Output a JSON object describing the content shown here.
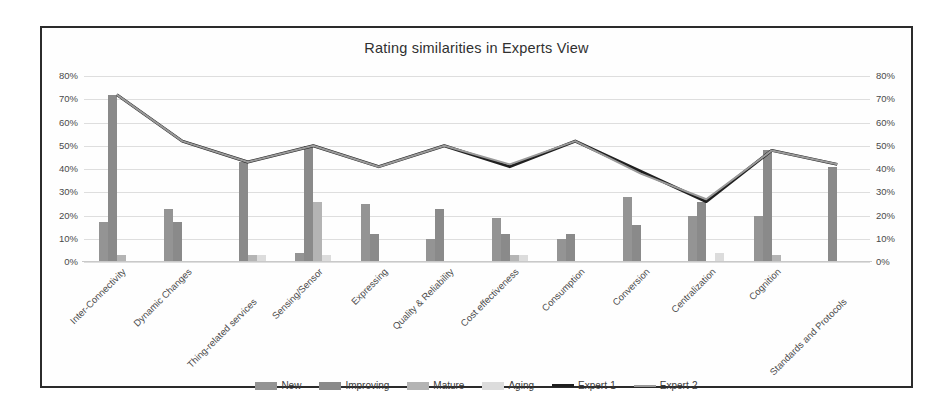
{
  "chart": {
    "title": "Rating similarities in Experts View",
    "legend_position": "bottom"
  },
  "axis": {
    "ticks": [
      "80%",
      "70%",
      "60%",
      "50%",
      "40%",
      "30%",
      "20%",
      "10%",
      "0%"
    ],
    "ylim": [
      0,
      80
    ]
  },
  "legend": [
    {
      "label": "New",
      "key": "new",
      "color": "#949494",
      "type": "bar"
    },
    {
      "label": "Improving",
      "key": "improving",
      "color": "#8a8a8a",
      "type": "bar"
    },
    {
      "label": "Mature",
      "key": "mature",
      "color": "#b4b4b4",
      "type": "bar"
    },
    {
      "label": "Aging",
      "key": "aging",
      "color": "#dcdcdc",
      "type": "bar"
    },
    {
      "label": "Expert-1",
      "key": "expert1",
      "color": "#1f1f1f",
      "type": "line"
    },
    {
      "label": "Expert-2",
      "key": "expert2",
      "color": "#9a9a9a",
      "type": "line"
    }
  ],
  "chart_data": {
    "type": "bar",
    "title": "Rating similarities in Experts View",
    "xlabel": "",
    "ylabel": "",
    "ylim": [
      0,
      80
    ],
    "ytick_labels": [
      "0%",
      "10%",
      "20%",
      "30%",
      "40%",
      "50%",
      "60%",
      "70%",
      "80%"
    ],
    "grid": true,
    "legend_position": "bottom",
    "categories": [
      "Inter-Connectivity",
      "Dynamic Changes",
      "Thing-related services",
      "Sensing/Sensor",
      "Expressing",
      "Quality & Reliability",
      "Cost effectiveness",
      "Consumption",
      "Conversion",
      "Centralization",
      "Cognition",
      "Standards and Protocols"
    ],
    "series": [
      {
        "name": "New",
        "type": "bar",
        "color": "#949494",
        "values": [
          17,
          23,
          0,
          4,
          25,
          10,
          19,
          10,
          28,
          20,
          20,
          0
        ]
      },
      {
        "name": "Improving",
        "type": "bar",
        "color": "#8a8a8a",
        "values": [
          72,
          17,
          43,
          50,
          12,
          23,
          12,
          12,
          16,
          26,
          48,
          41
        ]
      },
      {
        "name": "Mature",
        "type": "bar",
        "color": "#b4b4b4",
        "values": [
          3,
          0,
          3,
          26,
          0,
          0,
          3,
          0,
          0,
          0,
          3,
          0
        ]
      },
      {
        "name": "Aging",
        "type": "bar",
        "color": "#dcdcdc",
        "values": [
          0,
          0,
          3,
          3,
          0,
          0,
          3,
          0,
          0,
          4,
          0,
          0
        ]
      },
      {
        "name": "Expert-1",
        "type": "line",
        "color": "#1f1f1f",
        "values": [
          72,
          52,
          43,
          50,
          41,
          50,
          41,
          52,
          39,
          26,
          48,
          42
        ]
      },
      {
        "name": "Expert-2",
        "type": "line",
        "color": "#9a9a9a",
        "values": [
          72,
          52,
          43,
          50,
          41,
          50,
          42,
          52,
          38,
          27,
          48,
          42
        ]
      }
    ]
  }
}
